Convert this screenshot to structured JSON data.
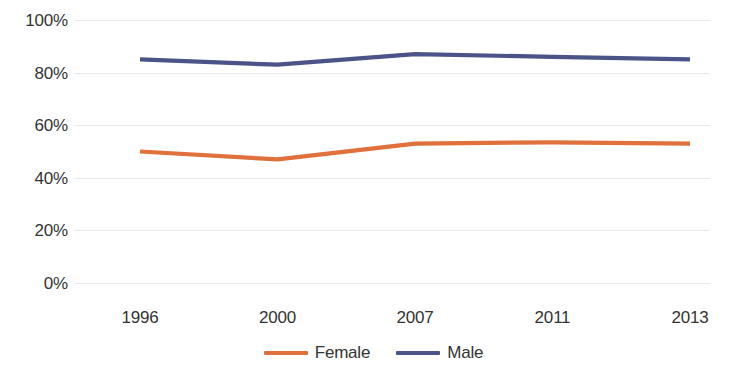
{
  "chart_data": {
    "type": "line",
    "title": "",
    "subtitle": "",
    "xlabel": "",
    "ylabel": "",
    "categories": [
      "1996",
      "2000",
      "2007",
      "2011",
      "2013"
    ],
    "series": [
      {
        "name": "Female",
        "color": "#E0703C",
        "values": [
          50,
          47,
          53,
          53.5,
          53
        ]
      },
      {
        "name": "Male",
        "color": "#4A5488",
        "values": [
          85,
          83,
          87,
          86,
          85
        ]
      }
    ],
    "ylim": [
      0,
      100
    ],
    "y_ticks": [
      0,
      20,
      40,
      60,
      80,
      100
    ],
    "y_tick_labels": [
      "0%",
      "20%",
      "40%",
      "60%",
      "80%",
      "100%"
    ],
    "grid": true,
    "grid_color": "#E9E9EA",
    "legend_position": "bottom-center",
    "value_suffix": "%"
  },
  "legend": {
    "items": [
      {
        "label": "Female",
        "color": "#E0703C"
      },
      {
        "label": "Male",
        "color": "#4A5488"
      }
    ]
  }
}
